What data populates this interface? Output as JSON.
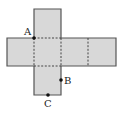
{
  "diagram": {
    "type": "cube-net",
    "colors": {
      "face": "#d8d8d8",
      "edge": "#555555",
      "fold": "#444444",
      "point": "#111111"
    },
    "points": [
      {
        "label": "A",
        "x": 34,
        "y": 38
      },
      {
        "label": "B",
        "x": 61,
        "y": 80
      },
      {
        "label": "C",
        "x": 48,
        "y": 95
      }
    ]
  }
}
